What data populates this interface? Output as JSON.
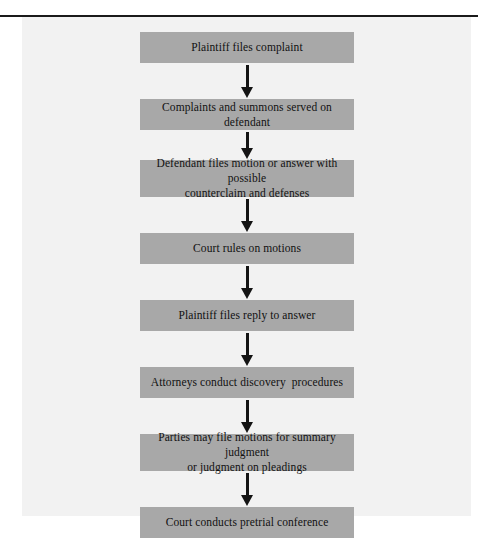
{
  "figure": {
    "panel_background": "#f2f2f2",
    "node_fill": "#a8a8a8",
    "connector_color": "#141414",
    "rule_color": "#1a1a1a"
  },
  "flowchart": {
    "type": "vertical-process-flow",
    "orientation": "top-to-bottom",
    "connector": "down-arrow",
    "node_count": 8,
    "nodes": [
      {
        "id": "step-1",
        "text": "Plaintiff files complaint",
        "lines": 1
      },
      {
        "id": "step-2",
        "text": "Complaints and summons served on defendant",
        "lines": 1
      },
      {
        "id": "step-3",
        "text": "Defendant files motion or answer with possible\ncounterclaim and defenses",
        "lines": 2
      },
      {
        "id": "step-4",
        "text": "Court rules on motions",
        "lines": 1
      },
      {
        "id": "step-5",
        "text": "Plaintiff files reply to answer",
        "lines": 1
      },
      {
        "id": "step-6",
        "text": "Attorneys conduct discovery  procedures",
        "lines": 1
      },
      {
        "id": "step-7",
        "text": "Parties may file motions for summary judgment\nor judgment on pleadings",
        "lines": 2
      },
      {
        "id": "step-8",
        "text": "Court conducts pretrial conference",
        "lines": 1
      }
    ],
    "arrows": [
      {
        "id": "arrow-1-2",
        "from": "step-1",
        "to": "step-2"
      },
      {
        "id": "arrow-2-3",
        "from": "step-2",
        "to": "step-3"
      },
      {
        "id": "arrow-3-4",
        "from": "step-3",
        "to": "step-4"
      },
      {
        "id": "arrow-4-5",
        "from": "step-4",
        "to": "step-5"
      },
      {
        "id": "arrow-5-6",
        "from": "step-5",
        "to": "step-6"
      },
      {
        "id": "arrow-6-7",
        "from": "step-6",
        "to": "step-7"
      },
      {
        "id": "arrow-7-8",
        "from": "step-7",
        "to": "step-8"
      }
    ]
  }
}
